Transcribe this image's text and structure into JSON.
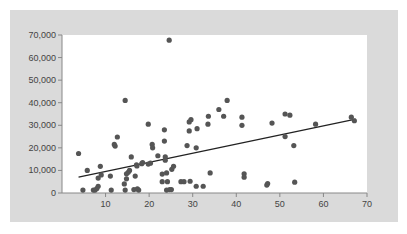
{
  "colors": {
    "panel": "#dadada",
    "plot_bg": "#ffffff",
    "axis": "#888888",
    "point": "#555555",
    "trendline": "#222222",
    "tick_text": "#444444"
  },
  "chart_data": {
    "type": "scatter",
    "title": "",
    "xlabel": "",
    "ylabel": "",
    "xlim": [
      0,
      70
    ],
    "ylim": [
      0,
      70000
    ],
    "grid": false,
    "legend": null,
    "x_ticks": [
      10,
      20,
      30,
      40,
      50,
      60,
      70
    ],
    "x_tick_labels": [
      "10",
      "20",
      "30",
      "40",
      "50",
      "60",
      "70"
    ],
    "y_ticks": [
      0,
      10000,
      20000,
      30000,
      40000,
      50000,
      60000,
      70000
    ],
    "y_tick_labels": [
      "0",
      "10,000",
      "20,000",
      "30,000",
      "40,000",
      "50,000",
      "60,000",
      "70,000"
    ],
    "series": [
      {
        "name": "points",
        "points": [
          [
            3.8,
            17500
          ],
          [
            4.8,
            1300
          ],
          [
            5.8,
            10000
          ],
          [
            7.2,
            1300
          ],
          [
            7.6,
            1300
          ],
          [
            8.0,
            2000
          ],
          [
            8.3,
            3000
          ],
          [
            8.3,
            6600
          ],
          [
            8.8,
            11800
          ],
          [
            9.0,
            8000
          ],
          [
            11.1,
            7500
          ],
          [
            11.3,
            1300
          ],
          [
            12.0,
            21500
          ],
          [
            12.2,
            20800
          ],
          [
            12.7,
            24800
          ],
          [
            14.3,
            4000
          ],
          [
            14.5,
            1300
          ],
          [
            14.5,
            41000
          ],
          [
            14.8,
            8500
          ],
          [
            14.8,
            6300
          ],
          [
            15.2,
            9200
          ],
          [
            15.5,
            10000
          ],
          [
            15.9,
            16000
          ],
          [
            16.5,
            1500
          ],
          [
            16.8,
            7500
          ],
          [
            17.1,
            12500
          ],
          [
            17.2,
            12000
          ],
          [
            17.3,
            1800
          ],
          [
            17.6,
            1300
          ],
          [
            18.3,
            13000
          ],
          [
            18.5,
            13500
          ],
          [
            19.8,
            12800
          ],
          [
            19.8,
            30500
          ],
          [
            20.3,
            13200
          ],
          [
            20.7,
            21500
          ],
          [
            20.8,
            20000
          ],
          [
            22.0,
            16500
          ],
          [
            23.0,
            8400
          ],
          [
            23.0,
            5000
          ],
          [
            23.5,
            28000
          ],
          [
            23.5,
            23000
          ],
          [
            23.7,
            16000
          ],
          [
            23.7,
            14500
          ],
          [
            24.0,
            8900
          ],
          [
            24.2,
            5000
          ],
          [
            24.6,
            67700
          ],
          [
            24.7,
            1500
          ],
          [
            24.0,
            1300
          ],
          [
            25.1,
            1500
          ],
          [
            25.2,
            10500
          ],
          [
            25.6,
            11800
          ],
          [
            27.3,
            5000
          ],
          [
            28.0,
            5000
          ],
          [
            28.7,
            21000
          ],
          [
            29.2,
            27500
          ],
          [
            29.2,
            31500
          ],
          [
            29.4,
            5200
          ],
          [
            29.6,
            32500
          ],
          [
            30.8,
            20000
          ],
          [
            31.0,
            28500
          ],
          [
            30.8,
            3000
          ],
          [
            32.4,
            3000
          ],
          [
            33.5,
            30500
          ],
          [
            33.6,
            34000
          ],
          [
            34.0,
            8900
          ],
          [
            36.0,
            37000
          ],
          [
            37.1,
            34000
          ],
          [
            37.9,
            41000
          ],
          [
            41.3,
            33600
          ],
          [
            41.3,
            30000
          ],
          [
            41.8,
            8500
          ],
          [
            41.8,
            7000
          ],
          [
            47.0,
            3500
          ],
          [
            47.2,
            4200
          ],
          [
            48.2,
            31000
          ],
          [
            51.2,
            35000
          ],
          [
            51.2,
            25000
          ],
          [
            52.3,
            34500
          ],
          [
            53.2,
            21000
          ],
          [
            53.4,
            4800
          ],
          [
            58.2,
            30500
          ],
          [
            66.4,
            33600
          ],
          [
            67.1,
            32000
          ]
        ]
      }
    ],
    "trendline": {
      "x": [
        3.8,
        67.4
      ],
      "y": [
        7000,
        32700
      ]
    }
  }
}
